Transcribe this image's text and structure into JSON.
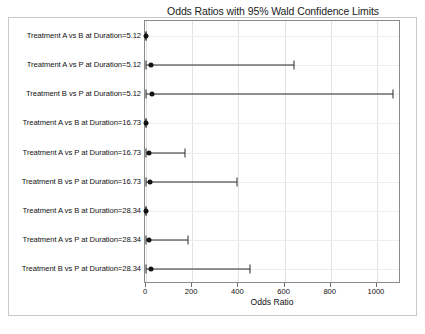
{
  "chart_data": {
    "type": "scatter",
    "subtype": "forest-plot",
    "title": "Odds Ratios with 95% Wald Confidence Limits",
    "xlabel": "Odds Ratio",
    "ylabel": "",
    "xlim": [
      0,
      1100
    ],
    "xticks": [
      0,
      200,
      400,
      600,
      800,
      1000
    ],
    "xtick_labels": [
      "0",
      "200",
      "400",
      "600",
      "800",
      "1000"
    ],
    "grid": true,
    "legend": "none",
    "categories": [
      "Treatment A vs B at Duration=5.12",
      "Treatment A vs P at Duration=5.12",
      "Treatment B vs P at Duration=5.12",
      "Treatment A vs B at Duration=16.73",
      "Treatment A vs P at Duration=16.73",
      "Treatment B vs P at Duration=16.73",
      "Treatment A vs B at Duration=28.34",
      "Treatment A vs P at Duration=28.34",
      "Treatment B vs P at Duration=28.34"
    ],
    "estimates": [
      1.0,
      22.0,
      28.0,
      0.4,
      12.0,
      18.0,
      0.5,
      15.0,
      20.0
    ],
    "lower_limits": [
      0.3,
      0.8,
      0.6,
      0.1,
      0.5,
      0.7,
      0.1,
      0.6,
      0.8
    ],
    "upper_limits": [
      2.0,
      642.0,
      1070.0,
      1.0,
      170.0,
      395.0,
      1.0,
      180.0,
      450.0
    ],
    "point_color": "#141414",
    "line_color": "#2b2b2b",
    "grid_color": "#e3e3e3",
    "frame_color": "#8a8a8a"
  }
}
